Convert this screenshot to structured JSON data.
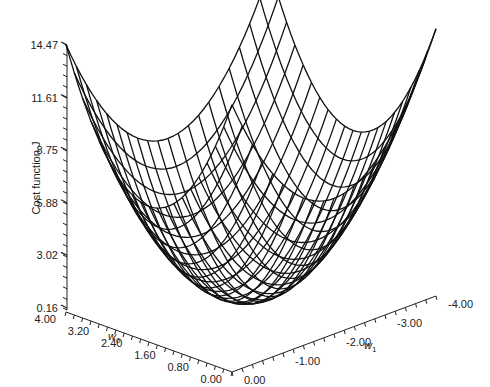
{
  "chart_data": {
    "type": "surface",
    "title": "",
    "zlabel": "Cost function J",
    "xlabel": "w0",
    "ylabel": "w1",
    "w0_ticks": [
      "0.00",
      "0.80",
      "1.60",
      "2.40",
      "3.20",
      "4.00"
    ],
    "w1_ticks": [
      "0.00",
      "-1.00",
      "-2.00",
      "-3.00",
      "-4.00"
    ],
    "j_ticks": [
      "0.16",
      "3.02",
      "5.88",
      "8.75",
      "11.61",
      "14.47"
    ],
    "w0_range": [
      0,
      4
    ],
    "w1_range": [
      -4,
      0
    ],
    "j_range": [
      0.16,
      14.47
    ],
    "surface": {
      "function": "J = a*((w0-2)^2 + (w1+2)^2) + Jmin",
      "a": 1.79,
      "Jmin": 0.16,
      "center": [
        2,
        -2
      ],
      "grid_lines_w0": 21,
      "grid_lines_w1": 21
    },
    "grid": false,
    "line_color": "#111111"
  },
  "labels": {
    "zlabel": "Cost function J",
    "w0_label": "w",
    "w0_sub": "0",
    "w1_label": "w",
    "w1_sub": "1"
  }
}
